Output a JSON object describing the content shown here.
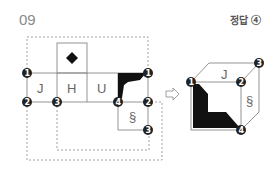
{
  "question": {
    "number": "09",
    "answer_label": "정답 ④"
  },
  "net": {
    "faces": [
      {
        "id": "top",
        "label": "◆"
      },
      {
        "id": "J",
        "label": "J"
      },
      {
        "id": "H",
        "label": "H"
      },
      {
        "id": "U",
        "label": "U"
      },
      {
        "id": "black",
        "label": ""
      },
      {
        "id": "section",
        "label": "§"
      }
    ],
    "vertex_markers": [
      "1",
      "2",
      "3",
      "4",
      "1",
      "2",
      "3"
    ]
  },
  "cube": {
    "faces": {
      "top": "J",
      "right": "§",
      "front": "black-L"
    },
    "vertex_markers": [
      "1",
      "2",
      "3",
      "4"
    ]
  },
  "arrow": "⇨",
  "colors": {
    "line": "#888888",
    "marker": "#222222",
    "fill": "#111111"
  }
}
